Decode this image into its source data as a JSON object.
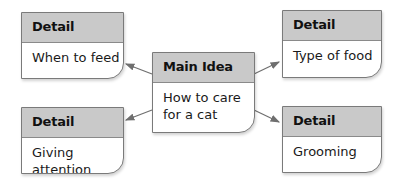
{
  "diagram": {
    "type": "main-idea-and-details",
    "colors": {
      "header_bg": "#c9c9c9",
      "border": "#7a7a7a",
      "arrow": "#6f6f6f"
    },
    "main": {
      "header": "Main Idea",
      "text_line1": "How to care",
      "text_line2": "for a cat"
    },
    "details": [
      {
        "position": "top-left",
        "header": "Detail",
        "text": "When to feed"
      },
      {
        "position": "top-right",
        "header": "Detail",
        "text": "Type of food"
      },
      {
        "position": "bottom-left",
        "header": "Detail",
        "text": "Giving attention"
      },
      {
        "position": "bottom-right",
        "header": "Detail",
        "text": "Grooming"
      }
    ]
  }
}
